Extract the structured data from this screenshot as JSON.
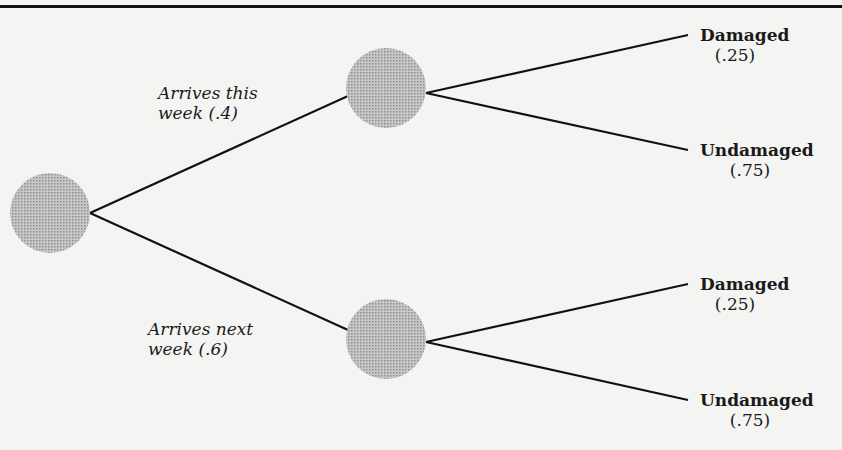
{
  "diagram": {
    "type": "probability-tree",
    "colors": {
      "node_fill": "#b4b4b4",
      "line": "#111111",
      "background": "#f4f4f2"
    },
    "root": {
      "label": ""
    },
    "branches": [
      {
        "label_line1": "Arrives this",
        "label_line2": "week (.4)",
        "probability": 0.4,
        "outcomes": [
          {
            "name": "Damaged",
            "prob": "(.25)"
          },
          {
            "name": "Undamaged",
            "prob": "(.75)"
          }
        ]
      },
      {
        "label_line1": "Arrives next",
        "label_line2": "week (.6)",
        "probability": 0.6,
        "outcomes": [
          {
            "name": "Damaged",
            "prob": "(.25)"
          },
          {
            "name": "Undamaged",
            "prob": "(.75)"
          }
        ]
      }
    ]
  }
}
